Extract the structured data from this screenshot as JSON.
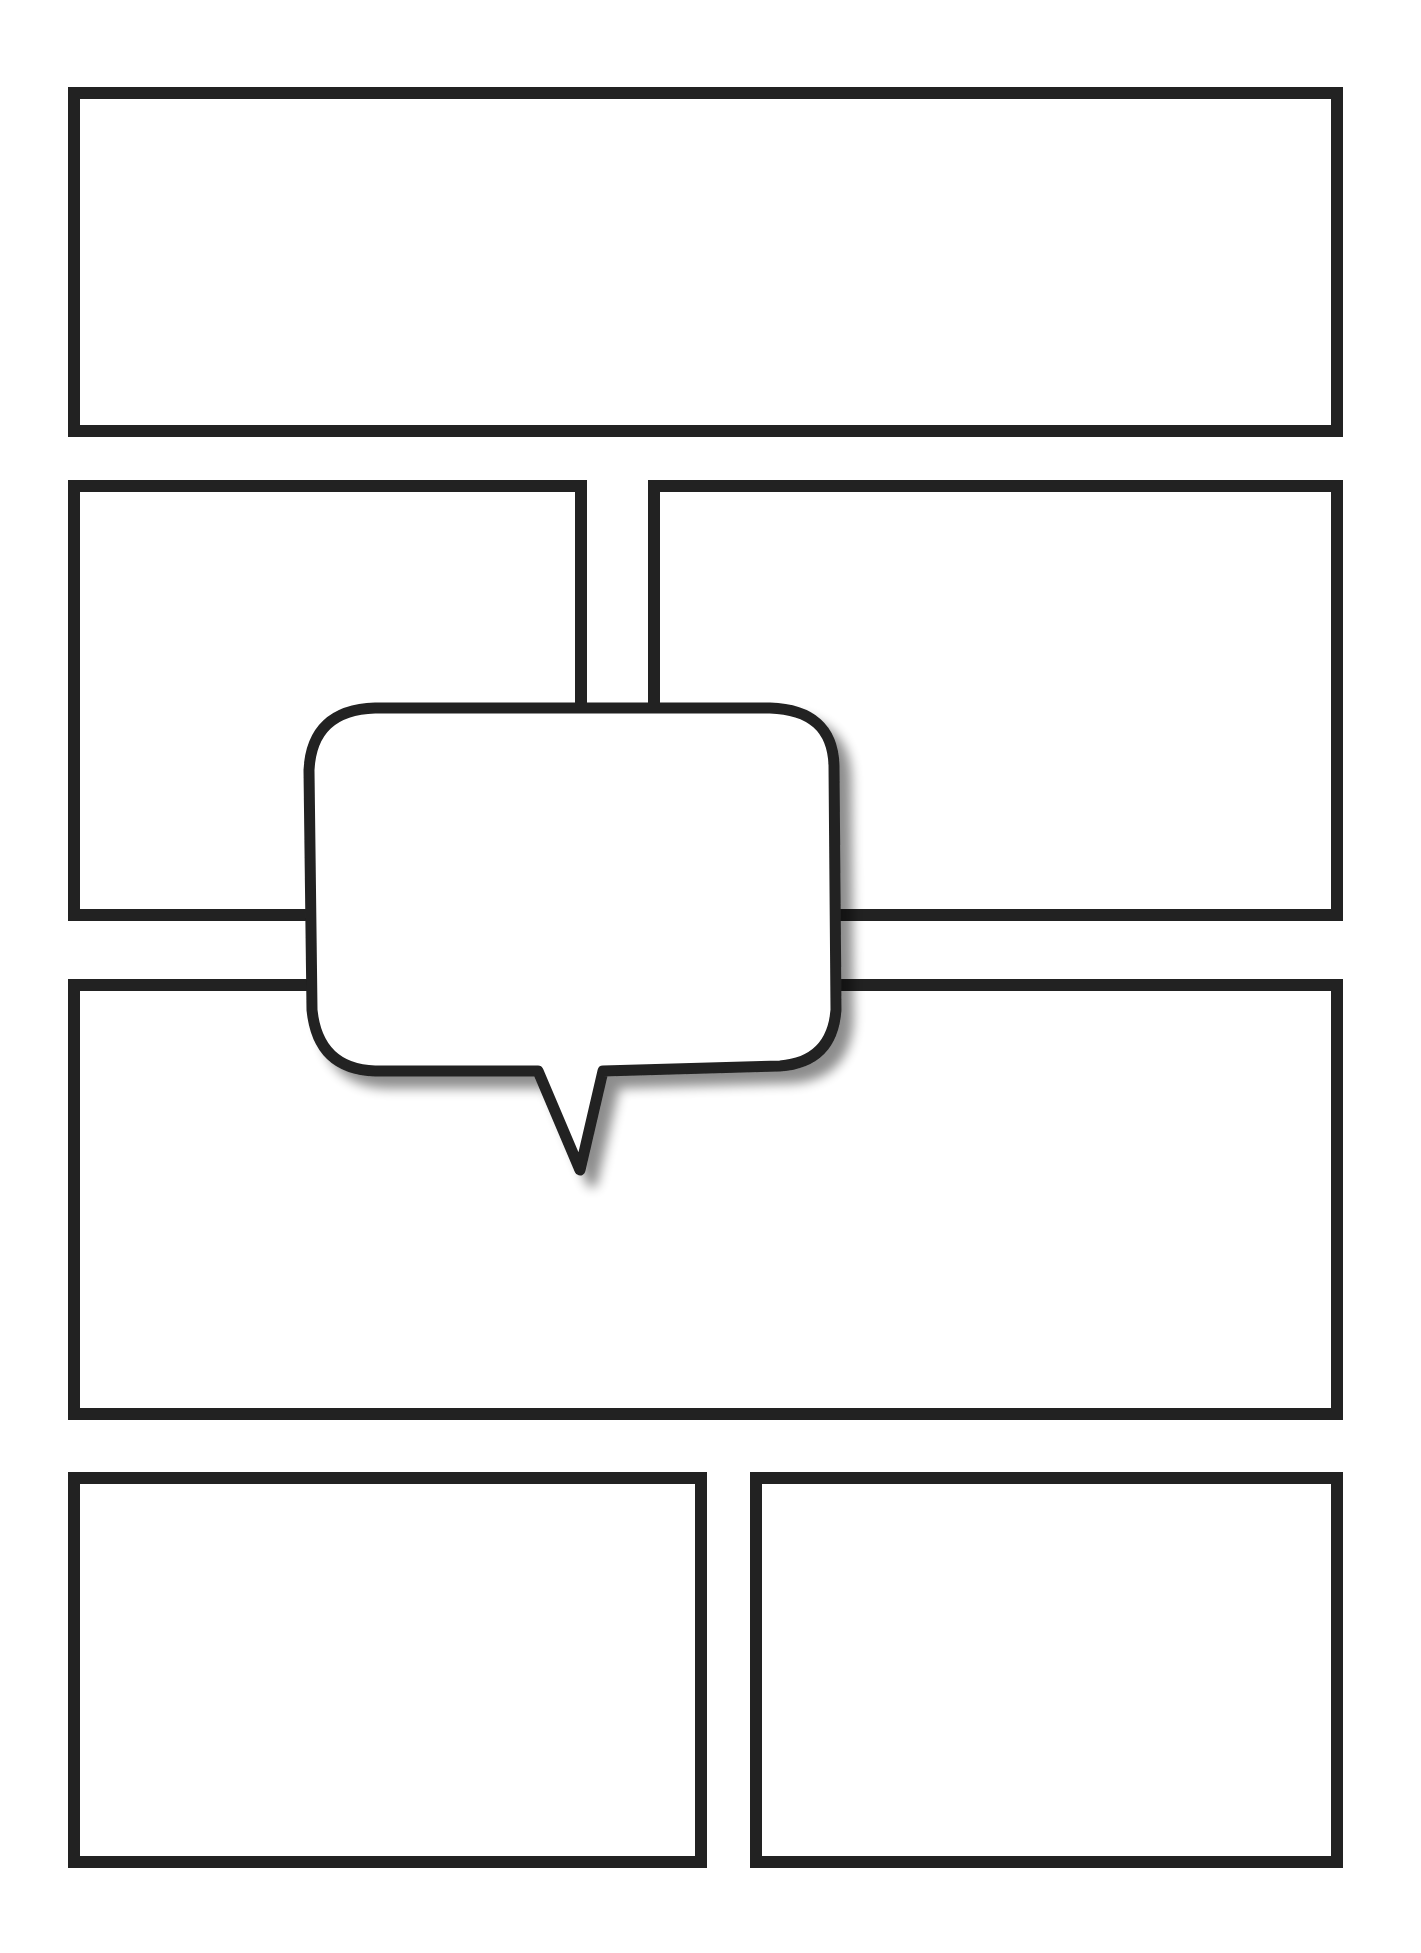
{
  "page": {
    "background": "#ffffff",
    "stroke_color": "#222222"
  },
  "panels": [
    {
      "id": "panel-1",
      "row": 1,
      "label": ""
    },
    {
      "id": "panel-2",
      "row": 2,
      "label": ""
    },
    {
      "id": "panel-3",
      "row": 2,
      "label": ""
    },
    {
      "id": "panel-4",
      "row": 3,
      "label": ""
    },
    {
      "id": "panel-5",
      "row": 4,
      "label": ""
    },
    {
      "id": "panel-6",
      "row": 4,
      "label": ""
    }
  ],
  "speech_bubble": {
    "text": "",
    "tail_direction": "down"
  }
}
